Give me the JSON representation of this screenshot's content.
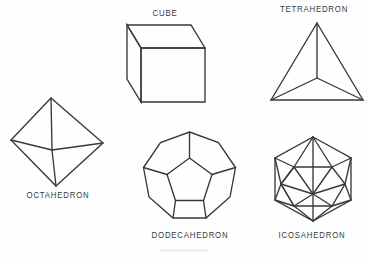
{
  "figure": {
    "background_color": "#fefefe",
    "stroke_color": "#38383c",
    "label_color": "#37373b",
    "width": 369,
    "height": 259
  },
  "solids": [
    {
      "id": "octahedron",
      "label": "OCTAHEDRON",
      "faces": 8,
      "vertices": 6,
      "edges": 12,
      "face_shape": "equilateral triangle",
      "label_position": "below",
      "view": "vertex-up rhombus silhouette with near vertex shown"
    },
    {
      "id": "cube",
      "label": "CUBE",
      "faces": 6,
      "vertices": 8,
      "edges": 12,
      "face_shape": "square",
      "label_position": "above",
      "view": "oblique projection, front face square, top and left faces receding"
    },
    {
      "id": "tetrahedron",
      "label": "TETRAHEDRON",
      "faces": 4,
      "vertices": 4,
      "edges": 6,
      "face_shape": "equilateral triangle",
      "label_position": "above",
      "view": "outer triangle with interior vertex joined to all three corners"
    },
    {
      "id": "dodecahedron",
      "label": "DODECAHEDRON",
      "faces": 12,
      "vertices": 20,
      "edges": 30,
      "face_shape": "regular pentagon",
      "label_position": "below",
      "view": "decagon outline with central pentagon and ring of pentagonal faces"
    },
    {
      "id": "icosahedron",
      "label": "ICOSAHEDRON",
      "faces": 20,
      "vertices": 12,
      "edges": 30,
      "face_shape": "equilateral triangle",
      "label_position": "below",
      "view": "hexagonal outline with top and bottom apex and triangulated interior"
    }
  ]
}
